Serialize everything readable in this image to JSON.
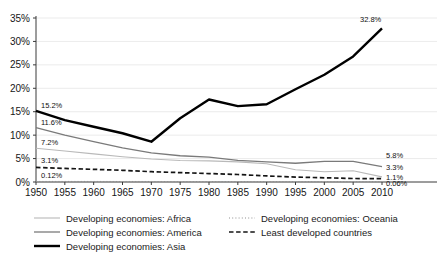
{
  "chart_data": {
    "type": "line",
    "title": "",
    "xlabel": "",
    "ylabel": "",
    "x": [
      1950,
      1955,
      1960,
      1965,
      1970,
      1975,
      1980,
      1985,
      1990,
      1995,
      2000,
      2005,
      2010
    ],
    "xlim": [
      1950,
      2010
    ],
    "ylim": [
      0,
      35
    ],
    "ytick_labels": [
      "0%",
      "5%",
      "10%",
      "15%",
      "20%",
      "25%",
      "30%",
      "35%"
    ],
    "ytick_values": [
      0,
      5,
      10,
      15,
      20,
      25,
      30,
      35
    ],
    "xtick_labels": [
      "1950",
      "1955",
      "1960",
      "1965",
      "1970",
      "1975",
      "1980",
      "1985",
      "1990",
      "1995",
      "2000",
      "2005",
      "2010"
    ],
    "grid": "horizontal",
    "legend_position": "bottom",
    "series": [
      {
        "name": "Developing economies: Africa",
        "style": "solid-light",
        "color": "#b9b9b9",
        "width": 1.1,
        "values": [
          7.2,
          6.6,
          6.0,
          5.4,
          4.9,
          4.6,
          4.5,
          4.3,
          3.9,
          2.6,
          2.2,
          2.4,
          1.1
        ],
        "start_label": "7.2%",
        "end_label": "1.1%"
      },
      {
        "name": "Developing economies: Oceania",
        "style": "dotted",
        "color": "#8f8f8f",
        "width": 1.0,
        "values": [
          0.12,
          0.12,
          0.12,
          0.11,
          0.11,
          0.1,
          0.1,
          0.09,
          0.09,
          0.08,
          0.08,
          0.07,
          0.063
        ],
        "start_label": "0.12%",
        "end_label": "0.06%"
      },
      {
        "name": "Developing economies: America",
        "style": "solid-medium",
        "color": "#7a7a7a",
        "width": 1.3,
        "values": [
          11.6,
          10.0,
          8.6,
          7.3,
          6.2,
          5.6,
          5.3,
          4.6,
          4.3,
          4.0,
          4.4,
          4.4,
          3.3
        ],
        "start_label": "11.6%",
        "end_label": "3.3%"
      },
      {
        "name": "Least developed countries",
        "style": "dashed",
        "color": "#141414",
        "width": 1.7,
        "values": [
          3.1,
          2.9,
          2.7,
          2.5,
          2.2,
          2.0,
          1.8,
          1.6,
          1.3,
          1.05,
          0.9,
          0.75,
          0.7
        ],
        "start_label": "3.1%",
        "end_label": ""
      },
      {
        "name": "Developing economies: Asia",
        "style": "solid-bold",
        "color": "#000000",
        "width": 2.4,
        "values": [
          15.2,
          13.2,
          11.8,
          10.4,
          8.6,
          13.6,
          17.6,
          16.2,
          16.6,
          19.8,
          22.9,
          26.8,
          32.8
        ],
        "start_label": "15.2%",
        "end_label": "32.8%"
      }
    ],
    "extra_right_label": "5.8%",
    "extra_right_value": 5.8
  },
  "legend": {
    "column_left": [
      {
        "label": "Developing economies: Africa",
        "swatch": "solid-light"
      },
      {
        "label": "Developing economies: America",
        "swatch": "solid-medium"
      },
      {
        "label": "Developing economies: Asia",
        "swatch": "solid-bold"
      }
    ],
    "column_right": [
      {
        "label": "Developing economies: Oceania",
        "swatch": "dotted"
      },
      {
        "label": "Least developed countries",
        "swatch": "dashed"
      }
    ]
  }
}
